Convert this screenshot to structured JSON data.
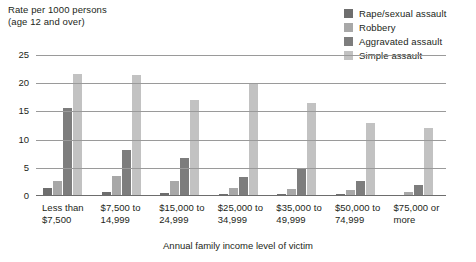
{
  "chart_data": {
    "type": "bar",
    "title": "",
    "ylabel": "Rate per 1000 persons\n(age 12 and over)",
    "xlabel": "Annual family income level of victim",
    "ylim": [
      0,
      25
    ],
    "yticks": [
      0,
      5,
      10,
      15,
      20,
      25
    ],
    "grid": true,
    "legend_position": "top-right",
    "categories": [
      "Less than\n$7,500",
      "$7,500 to\n14,999",
      "$15,000 to\n24,999",
      "$25,000 to\n34,999",
      "$35,000 to\n49,999",
      "$50,000 to\n74,999",
      "$75,000 or\nmore"
    ],
    "series": [
      {
        "name": "Rape/sexual assault",
        "color": "#6e6e6e",
        "values": [
          1.5,
          0.8,
          0.6,
          0.4,
          0.3,
          0.3,
          0.2
        ]
      },
      {
        "name": "Robbery",
        "color": "#a8a8a8",
        "values": [
          2.6,
          3.5,
          2.7,
          1.5,
          1.2,
          1.0,
          0.8
        ]
      },
      {
        "name": "Aggravated assault",
        "color": "#7d7d7d",
        "values": [
          15.6,
          8.2,
          6.8,
          3.3,
          5.0,
          2.7,
          2.0
        ]
      },
      {
        "name": "Simple assault",
        "color": "#c2c2c2",
        "values": [
          21.6,
          21.5,
          17.0,
          20.0,
          16.5,
          13.0,
          12.0
        ]
      }
    ]
  },
  "axis": {
    "y_title_line1": "Rate per 1000 persons",
    "y_title_line2": "(age 12 and over)",
    "x_title": "Annual family income level of victim"
  }
}
